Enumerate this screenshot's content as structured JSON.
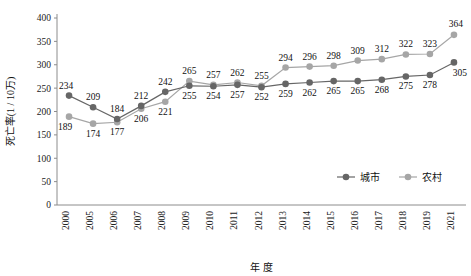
{
  "chart_data": {
    "type": "line",
    "title": "",
    "xlabel": "年  度",
    "ylabel": "死亡率(1 / 10万)",
    "categories": [
      "2000",
      "2005",
      "2006",
      "2007",
      "2008",
      "2009",
      "2010",
      "2011",
      "2012",
      "2013",
      "2014",
      "2015",
      "2016",
      "2017",
      "2018",
      "2019",
      "2021"
    ],
    "ylim": [
      0,
      400
    ],
    "yticks": [
      0,
      50,
      100,
      150,
      200,
      250,
      300,
      350,
      400
    ],
    "grid": false,
    "legend_position": "bottom-right",
    "series": [
      {
        "name": "城市",
        "color": "#666666",
        "values": [
          234,
          209,
          184,
          212,
          242,
          255,
          254,
          257,
          252,
          259,
          262,
          265,
          265,
          268,
          275,
          278,
          305
        ]
      },
      {
        "name": "农村",
        "color": "#a6a6a6",
        "values": [
          189,
          174,
          177,
          206,
          221,
          265,
          257,
          262,
          255,
          294,
          296,
          298,
          309,
          312,
          322,
          323,
          364
        ]
      }
    ]
  },
  "legend": {
    "items": [
      {
        "label": "城市"
      },
      {
        "label": "农村"
      }
    ]
  },
  "axes": {
    "y_title": "死亡率(1 / 10万)",
    "x_title": "年  度"
  }
}
